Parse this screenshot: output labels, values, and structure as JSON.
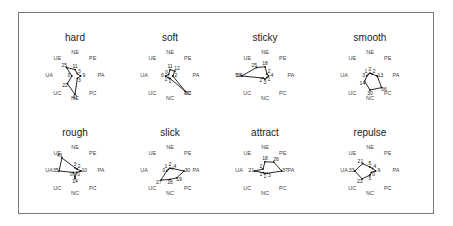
{
  "chart_data": {
    "type": "radar",
    "axes": [
      "NE",
      "PE",
      "PA",
      "PC",
      "NC",
      "UC",
      "UA",
      "UE"
    ],
    "layout": {
      "rows": 2,
      "cols": 4,
      "grid": false,
      "legend": "none"
    },
    "charts": [
      {
        "title": "hard",
        "values": [
          11,
          3,
          9,
          3,
          41,
          22,
          3,
          25
        ]
      },
      {
        "title": "soft",
        "values": [
          11,
          12,
          2,
          50,
          1,
          1,
          6,
          0
        ]
      },
      {
        "title": "sticky",
        "values": [
          18,
          2,
          4,
          1,
          3,
          2,
          53,
          25
        ]
      },
      {
        "title": "smooth",
        "values": [
          2,
          2,
          13,
          36,
          30,
          14,
          3,
          1
        ]
      },
      {
        "title": "rough",
        "values": [
          3,
          2,
          10,
          0,
          14,
          0,
          35,
          41
        ]
      },
      {
        "title": "slick",
        "values": [
          2,
          4,
          30,
          19,
          16,
          27,
          3,
          1
        ]
      },
      {
        "title": "attract",
        "values": [
          18,
          26,
          37,
          3,
          1,
          1,
          21,
          2
        ]
      },
      {
        "title": "repulse",
        "values": [
          5,
          4,
          9,
          0,
          5,
          23,
          33,
          21
        ]
      }
    ],
    "max_value": 55
  },
  "colors": {
    "line": "#111111",
    "frame": "#7a7a7a",
    "text": "#444444"
  }
}
